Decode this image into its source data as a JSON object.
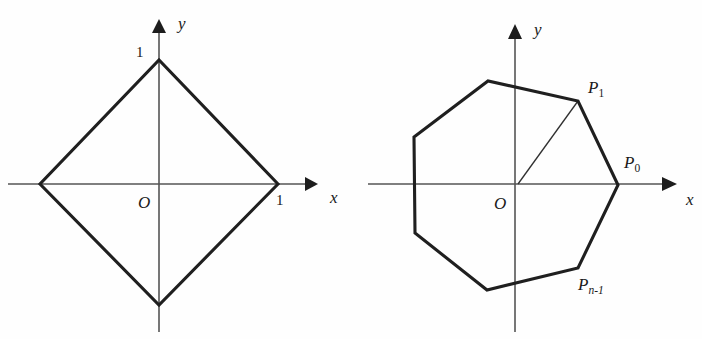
{
  "figure": {
    "background_color": "#fefefe",
    "outline_color": "#1f1f1f",
    "axis_color": "#555555",
    "label_color": "#1a1a1a"
  },
  "panels": [
    {
      "id": "left",
      "name": "diamond-panel",
      "shape_type": "polygon",
      "shape_name": "diamond",
      "vertex_count": 4,
      "origin_label": "O",
      "axes": {
        "x_label": "x",
        "y_label": "y"
      },
      "tick_labels": {
        "x_unit": "1",
        "y_unit": "1"
      },
      "vertices_math": [
        [
          1,
          0
        ],
        [
          0,
          1
        ],
        [
          -1,
          0
        ],
        [
          0,
          -1
        ]
      ],
      "vertices_px": [
        [
          278,
          184
        ],
        [
          159,
          60
        ],
        [
          40,
          184
        ],
        [
          159,
          305
        ]
      ],
      "origin_px": [
        159,
        184
      ],
      "axis_x_px": {
        "x1": 8,
        "x2": 318,
        "y": 184
      },
      "axis_y_px": {
        "y1": 330,
        "y2": 20,
        "x": 159
      }
    },
    {
      "id": "right",
      "name": "heptagon-panel",
      "shape_type": "polygon",
      "shape_name": "regular-heptagon",
      "vertex_count": 7,
      "origin_label": "O",
      "axes": {
        "x_label": "x",
        "y_label": "y"
      },
      "point_labels": [
        {
          "id": "P0",
          "text": "P",
          "sub": "0",
          "sub_italic": false
        },
        {
          "id": "P1",
          "text": "P",
          "sub": "1",
          "sub_italic": false
        },
        {
          "id": "Pn-1",
          "text": "P",
          "sub": "n-1",
          "sub_italic": true
        }
      ],
      "radius_drawn_to": "P1",
      "vertices_px": [
        [
          618,
          185
        ],
        [
          578,
          101
        ],
        [
          488,
          81
        ],
        [
          414,
          137
        ],
        [
          415,
          233
        ],
        [
          487,
          290
        ],
        [
          578,
          268
        ]
      ],
      "origin_px": [
        518,
        184
      ],
      "radius_px": 100,
      "axis_x_px": {
        "x1": 368,
        "x2": 680,
        "y": 184
      },
      "axis_y_px": {
        "y1": 330,
        "y2": 25,
        "x": 515
      }
    }
  ],
  "labels": {
    "left": {
      "y_tick": "1",
      "x_tick": "1",
      "origin": "O",
      "x_axis": "x",
      "y_axis": "y"
    },
    "right": {
      "origin": "O",
      "x_axis": "x",
      "y_axis": "y",
      "p0_base": "P",
      "p0_sub": "0",
      "p1_base": "P",
      "p1_sub": "1",
      "pn1_base": "P",
      "pn1_sub": "n-1"
    }
  }
}
